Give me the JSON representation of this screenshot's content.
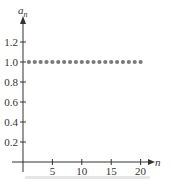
{
  "chart_data": {
    "type": "scatter",
    "title": "",
    "xlabel": "n",
    "ylabel": "a_n",
    "ylabel_base": "a",
    "ylabel_sub": "n",
    "x": [
      1,
      2,
      3,
      4,
      5,
      6,
      7,
      8,
      9,
      10,
      11,
      12,
      13,
      14,
      15,
      16,
      17,
      18,
      19,
      20
    ],
    "y": [
      1.0,
      1.0,
      1.0,
      1.0,
      1.0,
      1.0,
      1.0,
      1.0,
      1.0,
      1.0,
      1.0,
      1.0,
      1.0,
      1.0,
      1.0,
      1.0,
      1.0,
      1.0,
      1.0,
      1.0
    ],
    "xticks": [
      5,
      10,
      15,
      20
    ],
    "xtick_labels": [
      "5",
      "10",
      "15",
      "20"
    ],
    "yticks": [
      0.2,
      0.4,
      0.6,
      0.8,
      1.0,
      1.2
    ],
    "ytick_labels": [
      "0.2",
      "0.4",
      "0.6",
      "0.8",
      "1.0",
      "1.2"
    ],
    "xlim": [
      0,
      22
    ],
    "ylim": [
      0,
      1.35
    ],
    "grid": false,
    "legend": null,
    "colors": {
      "points": "#7a7a7a",
      "axis": "#333333"
    }
  }
}
